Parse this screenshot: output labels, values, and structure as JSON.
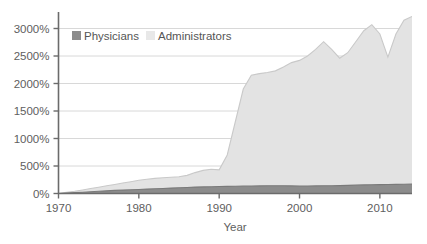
{
  "chart_data": {
    "type": "area",
    "title": "",
    "subtitle": "",
    "xlabel": "Year",
    "ylabel": "",
    "stacked": false,
    "grid": true,
    "grid_axis": "y",
    "legend_position": "top-left-inside",
    "xlim": [
      1970,
      2014
    ],
    "ylim": [
      0,
      3300
    ],
    "x_ticks": [
      1970,
      1980,
      1990,
      2000,
      2010
    ],
    "x_tick_labels": [
      "1970",
      "1980",
      "1990",
      "2000",
      "2010"
    ],
    "y_ticks": [
      0,
      500,
      1000,
      1500,
      2000,
      2500,
      3000
    ],
    "y_tick_labels": [
      "0%",
      "500%",
      "1000%",
      "1500%",
      "2000%",
      "2500%",
      "3000%"
    ],
    "x": [
      1970,
      1971,
      1972,
      1973,
      1974,
      1975,
      1976,
      1977,
      1978,
      1979,
      1980,
      1981,
      1982,
      1983,
      1984,
      1985,
      1986,
      1987,
      1988,
      1989,
      1990,
      1991,
      1992,
      1993,
      1994,
      1995,
      1996,
      1997,
      1998,
      1999,
      2000,
      2001,
      2002,
      2003,
      2004,
      2005,
      2006,
      2007,
      2008,
      2009,
      2010,
      2011,
      2012,
      2013,
      2014
    ],
    "series": [
      {
        "name": "Administrators",
        "color": "#e3e3e3",
        "line_color": "#c9c9c9",
        "values": [
          0,
          20,
          40,
          65,
          90,
          115,
          140,
          165,
          190,
          215,
          240,
          260,
          275,
          285,
          295,
          305,
          330,
          380,
          420,
          440,
          430,
          700,
          1300,
          1900,
          2150,
          2180,
          2200,
          2230,
          2300,
          2380,
          2420,
          2500,
          2620,
          2760,
          2620,
          2460,
          2560,
          2760,
          2960,
          3070,
          2900,
          2480,
          2900,
          3150,
          3220
        ]
      },
      {
        "name": "Physicians",
        "color": "#8c8c8c",
        "line_color": "#7a7a7a",
        "values": [
          0,
          8,
          16,
          24,
          32,
          40,
          48,
          56,
          62,
          68,
          74,
          80,
          86,
          92,
          98,
          104,
          110,
          116,
          120,
          124,
          128,
          130,
          132,
          134,
          136,
          138,
          140,
          140,
          140,
          138,
          136,
          136,
          138,
          140,
          142,
          144,
          148,
          152,
          156,
          160,
          162,
          164,
          166,
          168,
          170
        ]
      }
    ],
    "annotations": []
  },
  "legend": {
    "items": [
      {
        "label": "Physicians",
        "swatch": "#8c8c8c"
      },
      {
        "label": "Administrators",
        "swatch": "#e8e8e8"
      }
    ]
  },
  "axes": {
    "x_title": "Year",
    "axis_color": "#6b6b6b",
    "grid_color": "#d8d8d8"
  }
}
